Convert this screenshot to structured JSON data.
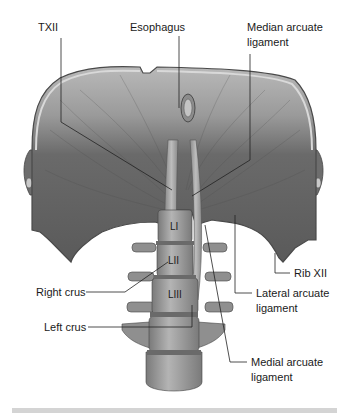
{
  "figure": {
    "type": "anatomical-illustration",
    "colors": {
      "muscle_dark": "#5b5b5b",
      "muscle_light": "#a8a8a8",
      "bone": "#9a9a9a",
      "leader_line": "#222222",
      "footer_bar": "#d4d4d4"
    }
  },
  "labels": {
    "txii": "TXII",
    "esophagus": "Esophagus",
    "median_arcuate_1": "Median arcuate",
    "median_arcuate_2": "ligament",
    "rib_xii": "Rib XII",
    "lateral_arcuate_1": "Lateral arcuate",
    "lateral_arcuate_2": "ligament",
    "right_crus": "Right crus",
    "left_crus": "Left crus",
    "medial_arcuate_1": "Medial arcuate",
    "medial_arcuate_2": "ligament"
  },
  "vertebra_labels": {
    "l1": "LI",
    "l2": "LII",
    "l3": "LIII"
  }
}
